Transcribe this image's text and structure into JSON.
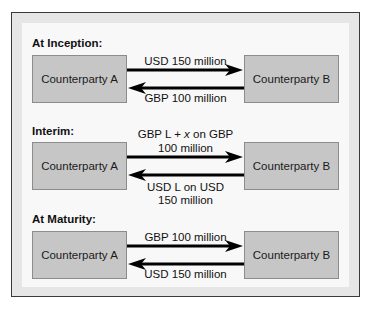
{
  "diagram": {
    "sections": [
      {
        "label": "At Inception:",
        "party_a": "Counterparty A",
        "party_b": "Counterparty B",
        "flow_a_to_b": [
          "USD 150 million"
        ],
        "flow_b_to_a": [
          "GBP 100 million"
        ]
      },
      {
        "label": "Interim:",
        "party_a": "Counterparty A",
        "party_b": "Counterparty B",
        "flow_a_to_b": [
          "GBP L + x on GBP",
          "100 million"
        ],
        "flow_b_to_a": [
          "USD L on USD",
          "150 million"
        ]
      },
      {
        "label": "At Maturity:",
        "party_a": "Counterparty A",
        "party_b": "Counterparty B",
        "flow_a_to_b": [
          "GBP 100 million"
        ],
        "flow_b_to_a": [
          "USD 150 million"
        ]
      }
    ],
    "interim_italic_symbol": "x",
    "colors": {
      "frame_border": "#3a3a3a",
      "frame_band": "#e6e6e6",
      "panel": "#f8f8f8",
      "box_fill": "#c6c6c6",
      "box_border": "#8c8c8c",
      "arrow": "#000000"
    }
  }
}
